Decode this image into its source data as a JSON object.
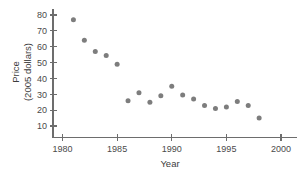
{
  "chart_data": {
    "type": "scatter",
    "title": "",
    "xlabel": "Year",
    "ylabel": "Price\n(2005 dollars)",
    "ylabel_line1": "Price",
    "ylabel_line2": "(2005 dollars)",
    "xlim": [
      1979,
      2001
    ],
    "ylim": [
      8,
      84
    ],
    "xticks": [
      1980,
      1985,
      1990,
      1995,
      2000
    ],
    "xtick_labels": [
      "1980",
      "1985",
      "1990",
      "1995",
      "2000"
    ],
    "yticks": [
      10,
      20,
      30,
      40,
      50,
      60,
      70,
      80
    ],
    "ytick_labels": [
      "10",
      "20",
      "30",
      "40",
      "50",
      "60",
      "70",
      "80"
    ],
    "grid": false,
    "legend": false,
    "marker_color": "#7d7d7d",
    "axis_color": "#6d6d6d",
    "x": [
      1981,
      1982,
      1983,
      1984,
      1985,
      1986,
      1987,
      1988,
      1989,
      1990,
      1991,
      1992,
      1993,
      1994,
      1995,
      1996,
      1997,
      1998
    ],
    "values": [
      77,
      64,
      57,
      54.5,
      49,
      26,
      31,
      25,
      29,
      35,
      29.5,
      27,
      23,
      21,
      22,
      25.5,
      23,
      15
    ],
    "points": [
      {
        "year": 1981,
        "price": 77
      },
      {
        "year": 1982,
        "price": 64
      },
      {
        "year": 1983,
        "price": 57
      },
      {
        "year": 1984,
        "price": 54.5
      },
      {
        "year": 1985,
        "price": 49
      },
      {
        "year": 1986,
        "price": 26
      },
      {
        "year": 1987,
        "price": 31
      },
      {
        "year": 1988,
        "price": 25
      },
      {
        "year": 1989,
        "price": 29
      },
      {
        "year": 1990,
        "price": 35
      },
      {
        "year": 1991,
        "price": 29.5
      },
      {
        "year": 1992,
        "price": 27
      },
      {
        "year": 1993,
        "price": 23
      },
      {
        "year": 1994,
        "price": 21
      },
      {
        "year": 1995,
        "price": 22
      },
      {
        "year": 1996,
        "price": 25.5
      },
      {
        "year": 1997,
        "price": 23
      },
      {
        "year": 1998,
        "price": 15
      }
    ]
  }
}
